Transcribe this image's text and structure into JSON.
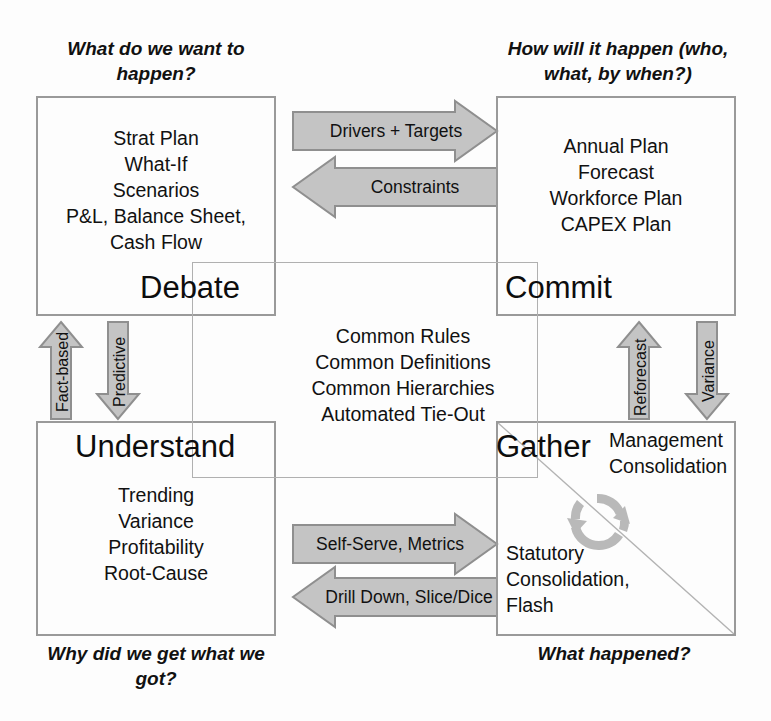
{
  "diagram": {
    "colors": {
      "arrow_fill": "#c4c4c4",
      "arrow_stroke": "#8f8f8f",
      "box_stroke": "#9a9a9a",
      "center_stroke": "#b0b0b0",
      "text": "#111111",
      "background": "#fdfdfd"
    }
  },
  "captions": {
    "top_left": "What do we want to happen?",
    "top_right": "How will it happen (who, what, by when?)",
    "bottom_left": "Why did we get what we got?",
    "bottom_right": "What happened?"
  },
  "quadrants": {
    "debate": {
      "title": "Debate",
      "items": [
        "Strat Plan",
        "What-If",
        "Scenarios",
        "P&L, Balance Sheet,",
        "Cash Flow"
      ]
    },
    "commit": {
      "title": "Commit",
      "items": [
        "Annual Plan",
        "Forecast",
        "Workforce Plan",
        "CAPEX Plan"
      ]
    },
    "understand": {
      "title": "Understand",
      "items": [
        "Trending",
        "Variance",
        "Profitability",
        "Root-Cause"
      ]
    },
    "gather": {
      "title": "Gather",
      "items_top": [
        "Management",
        "Consolidation"
      ],
      "items_bottom": [
        "Statutory",
        "Consolidation,",
        "Flash"
      ],
      "cycle_icon": "circular-arrows-icon"
    }
  },
  "center": {
    "items": [
      "Common Rules",
      "Common Definitions",
      "Common Hierarchies",
      "Automated Tie-Out"
    ]
  },
  "arrows": {
    "top_right_flow": {
      "label": "Drivers + Targets",
      "direction": "right"
    },
    "top_left_flow": {
      "label": "Constraints",
      "direction": "left"
    },
    "bottom_right_flow": {
      "label": "Self-Serve, Metrics",
      "direction": "right"
    },
    "bottom_left_flow": {
      "label": "Drill Down, Slice/Dice",
      "direction": "left"
    },
    "left_up": {
      "label": "Fact-based",
      "direction": "up"
    },
    "left_down": {
      "label": "Predictive",
      "direction": "down"
    },
    "right_up": {
      "label": "Reforecast",
      "direction": "up"
    },
    "right_down": {
      "label": "Variance",
      "direction": "down"
    }
  }
}
